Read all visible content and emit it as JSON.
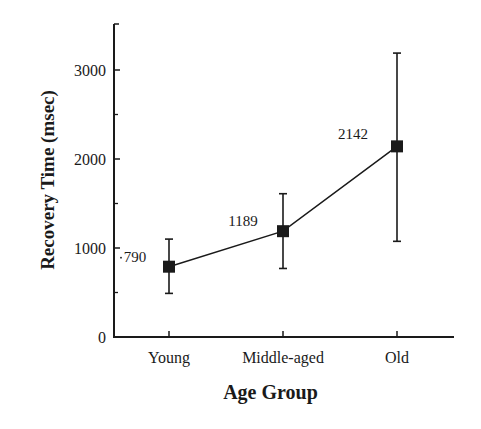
{
  "chart_data": {
    "type": "line",
    "title": "",
    "xlabel": "Age Group",
    "ylabel": "Recovery Time (msec)",
    "categories": [
      "Young",
      "Middle-aged",
      "Old"
    ],
    "series": [
      {
        "name": "Recovery Time",
        "values": [
          790,
          1189,
          2142
        ],
        "data_labels": [
          "790",
          "1189",
          "2142"
        ],
        "error_upper": [
          1100,
          1610,
          3190
        ],
        "error_lower": [
          490,
          770,
          1075
        ],
        "marker": "square",
        "color": "#1a1a1a"
      }
    ],
    "yticks": [
      0,
      1000,
      2000,
      3000
    ],
    "ytick_labels": [
      "0",
      "1000",
      "2000",
      "3000"
    ],
    "minor_yticks": [
      500,
      1500,
      2500
    ],
    "ylim": [
      0,
      3500
    ],
    "grid": false,
    "legend": null
  },
  "axes": {
    "y_label": "Recovery Time (msec)",
    "x_label": "Age Group"
  }
}
